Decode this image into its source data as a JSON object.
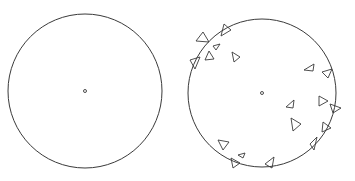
{
  "figure": {
    "width": 355,
    "height": 181,
    "stroke_color": "#3a3a3a",
    "background": "#ffffff",
    "panels": [
      {
        "name": "empty-circle",
        "circle": {
          "cx": 85,
          "cy": 91,
          "r": 77
        },
        "center_dot": {
          "cx": 85,
          "cy": 91,
          "r": 1.5
        },
        "triangles": []
      },
      {
        "name": "circle-with-triangles",
        "circle": {
          "cx": 262,
          "cy": 93,
          "r": 74
        },
        "center_dot": {
          "cx": 262,
          "cy": 93,
          "r": 1.5
        },
        "triangles": [
          "203,32 209,42 196,41",
          "224,24 231,30 221,36",
          "213,46 220,44 216,50",
          "209,51 214,59 205,60",
          "190,60 200,57 195,69",
          "232,52 240,57 234,62",
          "304,70 314,64 313,71",
          "322,72 332,69 328,78",
          "319,96 328,101 319,106",
          "330,104 341,108 333,113",
          "286,107 294,100 293,108",
          "291,118 301,124 293,131",
          "323,122 331,128 322,132",
          "310,144 317,137 314,150",
          "218,140 229,142 223,150",
          "238,155 245,153 243,158",
          "231,158 240,163 233,168",
          "265,164 274,157 272,168"
        ]
      }
    ]
  }
}
